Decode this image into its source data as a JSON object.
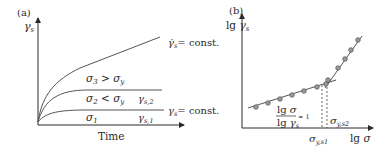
{
  "panel_a": {
    "tag": "(a)",
    "y_axis_label": "γs",
    "x_axis_label": "Time",
    "curves": [
      {
        "label": "σ3 > σy",
        "label_main": "σ",
        "sub": "3",
        "rest": " > σ",
        "rest_sub": "y",
        "end_label": "γ̇s = const.",
        "type": "increasing"
      },
      {
        "label": "σ2 < σy",
        "label_main": "σ",
        "sub": "2",
        "rest": " < σ",
        "rest_sub": "y",
        "end_label": "γs,2",
        "type": "plateau"
      },
      {
        "label": "σ1",
        "label_main": "σ",
        "sub": "1",
        "end_label": "γs,1",
        "type": "plateau"
      }
    ],
    "right_label_const_rate": "= const.",
    "right_label_const": "= const."
  },
  "panel_b": {
    "tag": "(b)",
    "y_axis_label": "lg γs",
    "x_axis_label": "lg σ",
    "slope_annotation": {
      "numerator": "lg σ",
      "denominator": "lg γs",
      "value": "≈ 1"
    },
    "marker_labels": {
      "sigma_ys1": "σy,s1",
      "sigma_ys2": "σy,s2"
    }
  },
  "colors": {
    "axis": "#2a2a2a",
    "line": "#555555",
    "marker_fill": "#9a9a9a"
  }
}
